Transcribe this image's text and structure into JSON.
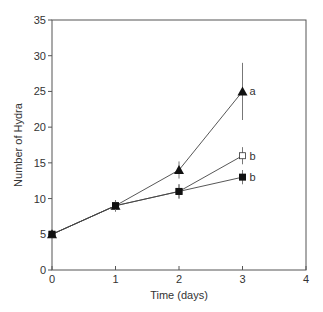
{
  "chart_data": {
    "type": "line",
    "title": "",
    "xlabel": "Time  (days)",
    "ylabel": "Number  of  Hydra",
    "xlim": [
      0,
      4
    ],
    "ylim": [
      0,
      35
    ],
    "xticks": [
      0,
      1,
      2,
      3,
      4
    ],
    "yticks": [
      0,
      5,
      10,
      15,
      20,
      25,
      30,
      35
    ],
    "grid": false,
    "series": [
      {
        "name": "triangle",
        "marker": "filled-triangle",
        "x": [
          0,
          1,
          2,
          3
        ],
        "y": [
          5,
          9,
          14,
          25
        ],
        "err": [
          0.3,
          0.8,
          1.2,
          4
        ],
        "label_at_end": "a"
      },
      {
        "name": "open-square",
        "marker": "open-square",
        "x": [
          0,
          1,
          2,
          3
        ],
        "y": [
          5,
          9,
          11,
          16
        ],
        "err": [
          0.3,
          0.8,
          1,
          1.2
        ],
        "label_at_end": "b"
      },
      {
        "name": "filled-square",
        "marker": "filled-square",
        "x": [
          0,
          1,
          2,
          3
        ],
        "y": [
          5,
          9,
          11,
          13
        ],
        "err": [
          0.3,
          0.8,
          1,
          1
        ],
        "label_at_end": "b"
      }
    ]
  }
}
